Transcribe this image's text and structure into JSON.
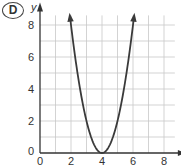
{
  "badge": {
    "label": "D"
  },
  "chart_data": {
    "type": "line",
    "title": "",
    "xlabel": "x",
    "ylabel": "y",
    "xlim": [
      0,
      9
    ],
    "ylim": [
      0,
      9
    ],
    "x_ticks": [
      0,
      2,
      4,
      6,
      8
    ],
    "y_ticks": [
      0,
      2,
      4,
      6,
      8
    ],
    "grid": true,
    "grid_step": 1,
    "series": [
      {
        "name": "y = 2(x - 4)^2",
        "x": [
          2,
          2.5,
          3,
          3.5,
          4,
          4.5,
          5,
          5.5,
          6
        ],
        "y": [
          8,
          4.5,
          2,
          0.5,
          0,
          0.5,
          2,
          4.5,
          8
        ],
        "arrows_at_ends": true,
        "vertex": [
          4,
          0
        ]
      }
    ],
    "colors": {
      "curve": "#3a3a3a",
      "grid": "#c8c8c8",
      "axis": "#333333"
    }
  }
}
